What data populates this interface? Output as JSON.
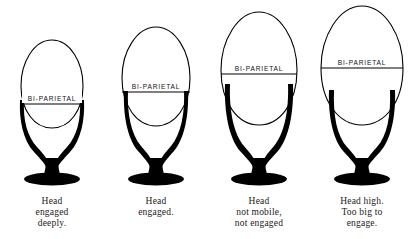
{
  "figure": {
    "label_text": "BI-PARIETAL",
    "colors": {
      "pelvis": "#000000",
      "head_outline": "#000000",
      "background": "#ffffff",
      "label_text": "#111111",
      "caption_text": "#1a1a1a"
    }
  },
  "panels": [
    {
      "id": "stage-1",
      "name": "head-engaged-deeply",
      "bi_parietal_label": "BI-PARIETAL",
      "caption_lines": [
        "Head",
        "engaged",
        "deeply."
      ],
      "head": {
        "relative_size": "smallest",
        "center_x": 52,
        "center_y": 88,
        "rx": 31,
        "ry": 48
      },
      "bi_parietal_line_y": 104,
      "pelvis": {
        "brim_y": 100,
        "base_y": 182
      }
    },
    {
      "id": "stage-2",
      "name": "head-engaged",
      "bi_parietal_label": "BI-PARIETAL",
      "caption_lines": [
        "Head",
        "engaged."
      ],
      "head": {
        "relative_size": "small",
        "center_x": 52,
        "center_y": 80,
        "rx": 34,
        "ry": 53
      },
      "bi_parietal_line_y": 92,
      "pelvis": {
        "brim_y": 90,
        "base_y": 182
      }
    },
    {
      "id": "stage-3",
      "name": "head-not-mobile-not-engaged",
      "bi_parietal_label": "BI-PARIETAL",
      "caption_lines": [
        "Head",
        "not mobile,",
        "not engaged"
      ],
      "head": {
        "relative_size": "large",
        "center_x": 52,
        "center_y": 72,
        "rx": 38,
        "ry": 60
      },
      "bi_parietal_line_y": 74,
      "pelvis": {
        "brim_y": 84,
        "base_y": 182
      }
    },
    {
      "id": "stage-4",
      "name": "head-high-too-big-to-engage",
      "bi_parietal_label": "BI-PARIETAL",
      "caption_lines": [
        "Head high.",
        "Too big to",
        "engage."
      ],
      "head": {
        "relative_size": "largest",
        "center_x": 52,
        "center_y": 68,
        "rx": 41,
        "ry": 62
      },
      "bi_parietal_line_y": 68,
      "pelvis": {
        "brim_y": 90,
        "base_y": 182
      }
    }
  ]
}
